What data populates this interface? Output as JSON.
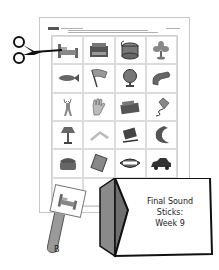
{
  "worksheet": {
    "header_text": null,
    "grid": {
      "rows": 6,
      "columns": 4,
      "cells": [
        {
          "row": 1,
          "col": 1,
          "image": "bed"
        },
        {
          "row": 1,
          "col": 2,
          "image": "typewriter"
        },
        {
          "row": 1,
          "col": 3,
          "image": "drum"
        },
        {
          "row": 1,
          "col": 4,
          "image": "fan"
        },
        {
          "row": 2,
          "col": 1,
          "image": "fish"
        },
        {
          "row": 2,
          "col": 2,
          "image": "flag"
        },
        {
          "row": 2,
          "col": 3,
          "image": "globe"
        },
        {
          "row": 2,
          "col": 4,
          "image": "glove"
        },
        {
          "row": 3,
          "col": 1,
          "image": "deer"
        },
        {
          "row": 3,
          "col": 2,
          "image": "hand"
        },
        {
          "row": 3,
          "col": 3,
          "image": "radio"
        },
        {
          "row": 3,
          "col": 4,
          "image": "kite"
        },
        {
          "row": 4,
          "col": 1,
          "image": "lamp"
        },
        {
          "row": 4,
          "col": 2,
          "image": "boomerang"
        },
        {
          "row": 4,
          "col": 3,
          "image": "book"
        },
        {
          "row": 4,
          "col": 4,
          "image": "moon"
        },
        {
          "row": 5,
          "col": 1,
          "image": "phone"
        },
        {
          "row": 5,
          "col": 2,
          "image": "candy"
        },
        {
          "row": 5,
          "col": 3,
          "image": "lips"
        },
        {
          "row": 5,
          "col": 4,
          "image": "car"
        }
      ],
      "caption_text": null
    }
  },
  "stick": {
    "letter": "B",
    "image": "bed"
  },
  "folder": {
    "title_line1": "Final Sound",
    "title_line2": "Sticks:",
    "title_line3": "Week 9"
  },
  "icons": {
    "scissors": "scissors-icon"
  },
  "colors": {
    "ink": "#222222",
    "folder_side": "#8a8a8a",
    "stick": "#9a9a9a"
  }
}
